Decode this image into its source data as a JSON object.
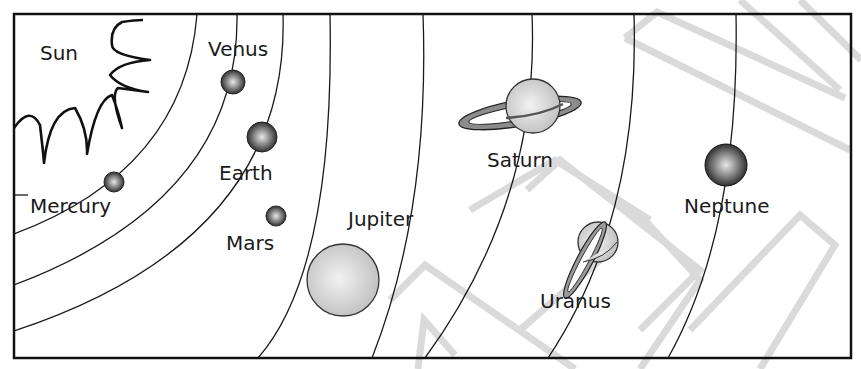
{
  "diagram": {
    "labels": {
      "sun": "Sun",
      "mercury": "Mercury",
      "venus": "Venus",
      "earth": "Earth",
      "mars": "Mars",
      "jupiter": "Jupiter",
      "saturn": "Saturn",
      "uranus": "Uranus",
      "neptune": "Neptune"
    },
    "colors": {
      "line": "#1a1a1a",
      "frame": "#111111",
      "watermark": "#cfcfcf",
      "planet_dark": "#2a2a2a",
      "planet_light": "#d8d8d8"
    }
  }
}
